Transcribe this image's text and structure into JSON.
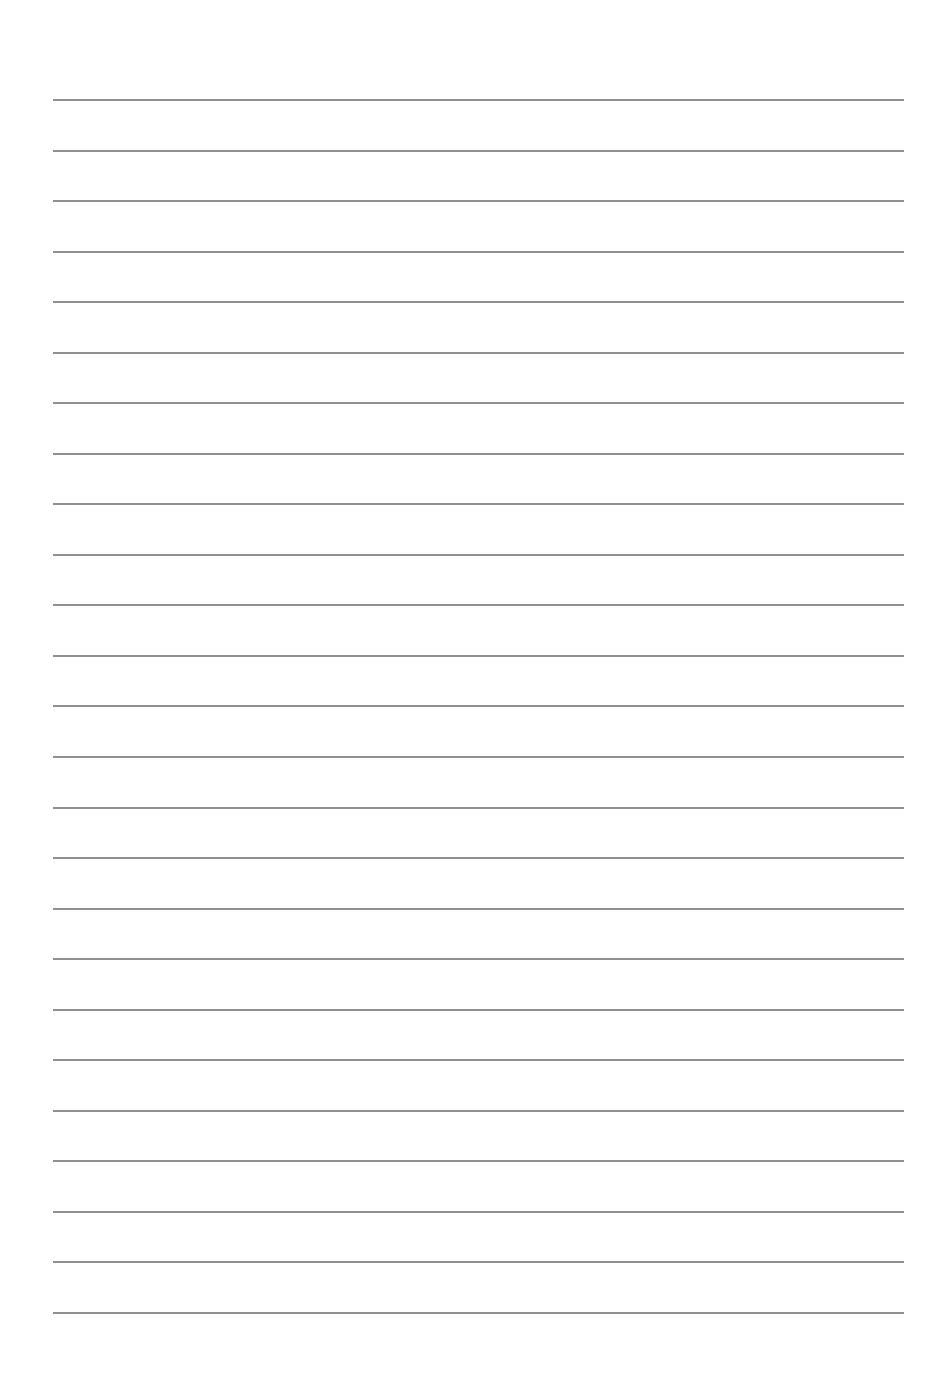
{
  "page": {
    "type": "lined-paper",
    "background_color": "#ffffff",
    "line_color": "#8f8f8f",
    "line_count": 25,
    "first_line_y": 99,
    "line_spacing": 50.54,
    "line_left": 53,
    "line_right": 904
  }
}
